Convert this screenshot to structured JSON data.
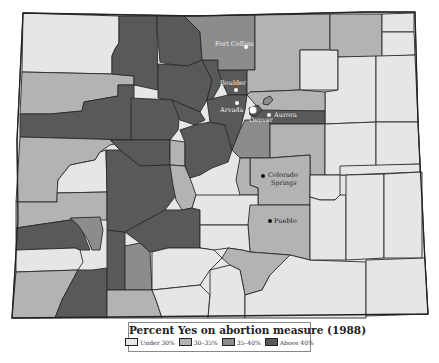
{
  "map": {
    "region": "Colorado counties",
    "cities": [
      {
        "name": "Fort Collins",
        "x": 246,
        "y": 47,
        "label_x": 215,
        "label_y": 46,
        "theme": "light"
      },
      {
        "name": "Boulder",
        "x": 236,
        "y": 90,
        "label_x": 220,
        "label_y": 85,
        "theme": "light"
      },
      {
        "name": "Arvada",
        "x": 237,
        "y": 103,
        "label_x": 220,
        "label_y": 112,
        "theme": "light"
      },
      {
        "name": "Denver",
        "x": 253,
        "y": 110,
        "label_x": 249,
        "label_y": 122,
        "theme": "light"
      },
      {
        "name": "Aurora",
        "x": 269,
        "y": 115,
        "label_x": 274,
        "label_y": 117,
        "theme": "light"
      },
      {
        "name": "Colorado",
        "x": 263,
        "y": 176,
        "label_x": 268,
        "label_y": 177,
        "theme": "dark"
      },
      {
        "name": "Springs",
        "x": 263,
        "y": 176,
        "label_x": 271,
        "label_y": 185,
        "theme": "dark"
      },
      {
        "name": "Pueblo",
        "x": 270,
        "y": 221,
        "label_x": 274,
        "label_y": 223,
        "theme": "dark"
      }
    ]
  },
  "legend": {
    "title": "Percent Yes on abortion measure (1988)",
    "items": [
      {
        "label": "Under 30%",
        "color": "#e6e6e6"
      },
      {
        "label": "30–35%",
        "color": "#b3b3b3"
      },
      {
        "label": "35–40%",
        "color": "#8c8c8c"
      },
      {
        "label": "Above 40%",
        "color": "#595959"
      }
    ]
  }
}
